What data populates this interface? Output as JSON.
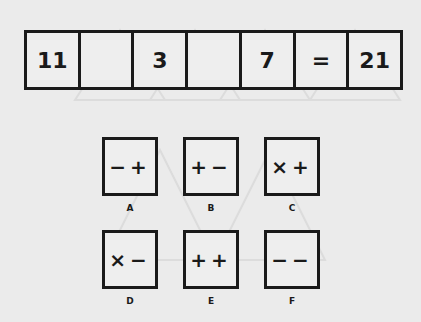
{
  "equation": {
    "cells": [
      "11",
      "",
      "3",
      "",
      "7",
      "=",
      "21"
    ]
  },
  "options": [
    {
      "label": "A",
      "symbols": "−+"
    },
    {
      "label": "B",
      "symbols": "+−"
    },
    {
      "label": "C",
      "symbols": "×+"
    },
    {
      "label": "D",
      "symbols": "×−"
    },
    {
      "label": "E",
      "symbols": "++"
    },
    {
      "label": "F",
      "symbols": "−−"
    }
  ]
}
